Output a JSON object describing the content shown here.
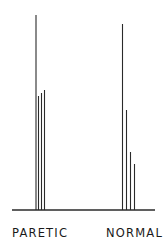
{
  "chart_data": {
    "type": "bar",
    "title": "",
    "xlabel": "",
    "ylabel": "",
    "categories": [
      "PARETIC",
      "NORMAL"
    ],
    "series_description": "Each group shows four thin vertical lines (spikes) of differing heights rising from a common baseline; heights in pixels above baseline",
    "groups": [
      {
        "name": "PARETIC",
        "values": [
          195,
          114,
          117,
          120
        ],
        "x_positions": [
          36,
          38.5,
          41.5,
          44.5
        ]
      },
      {
        "name": "NORMAL",
        "values": [
          186,
          100,
          58,
          46
        ],
        "x_positions": [
          122.5,
          126.5,
          130.5,
          134.5
        ]
      }
    ],
    "baseline_y": 210,
    "baseline_x_range": [
      12,
      155
    ],
    "grid": false,
    "legend": null,
    "colors": {
      "lines": "#2a2a2a",
      "background": "#ffffff"
    }
  },
  "labels": {
    "left": "PARETIC",
    "right": "NORMAL"
  }
}
